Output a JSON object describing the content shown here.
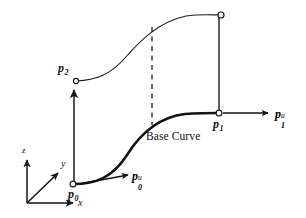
{
  "figure": {
    "background_color": "#ffffff",
    "stroke_color": "#1a1a1a",
    "width": 306,
    "height": 218
  },
  "axes": {
    "origin_label": "",
    "x": {
      "label": "x",
      "name": "x-axis"
    },
    "y": {
      "label": "y",
      "name": "y-axis"
    },
    "z": {
      "label": "z",
      "name": "z-axis"
    }
  },
  "labels": {
    "p0": {
      "base": "p",
      "sub": "0",
      "sup": ""
    },
    "p1": {
      "base": "p",
      "sub": "1",
      "sup": ""
    },
    "p2": {
      "base": "p",
      "sub": "2",
      "sup": ""
    },
    "p0u": {
      "base": "p",
      "sub": "0",
      "sup": "u"
    },
    "p1u": {
      "base": "p",
      "sub": "1",
      "sup": "u"
    },
    "base_curve": "Base Curve"
  },
  "geometry": {
    "points": [
      {
        "name": "p0",
        "x": 73,
        "y": 184,
        "marker": "open-circle"
      },
      {
        "name": "p1",
        "x": 218,
        "y": 113,
        "marker": "open-circle"
      },
      {
        "name": "p2",
        "x": 76,
        "y": 81,
        "marker": "open-circle"
      },
      {
        "name": "p3_top_right",
        "x": 221,
        "y": 15,
        "marker": "open-circle"
      }
    ],
    "base_curve_path": "M 73 184 C 96 184 112 178 127 155 C 142 131 160 117 185 114 C 200 113 210 113 218 113",
    "top_curve_path": "M 76 81 C 96 80 110 75 125 58 C 140 41 158 22 186 16 C 200 14 212 15 221 15",
    "dashed_line": {
      "x": 152,
      "y_top": 27,
      "y_bottom": 125
    },
    "vertical_left": {
      "x": 74,
      "y_top": 86,
      "y_bottom": 184,
      "arrowhead": "up"
    },
    "vertical_right": {
      "x": 219,
      "y_top": 15,
      "y_bottom": 113,
      "arrowhead": "none"
    },
    "tangent_p0u": {
      "x1": 78,
      "y1": 184,
      "x2": 131,
      "y2": 175,
      "arrowhead": "end"
    },
    "tangent_p1u": {
      "x1": 222,
      "y1": 113,
      "x2": 272,
      "y2": 113,
      "arrowhead": "end"
    },
    "axis_origin": {
      "x": 27,
      "y": 203
    },
    "axis_x_end": {
      "x": 78,
      "y": 203
    },
    "axis_y_end": {
      "x": 62,
      "y": 170
    },
    "axis_z_end": {
      "x": 27,
      "y": 155
    }
  }
}
